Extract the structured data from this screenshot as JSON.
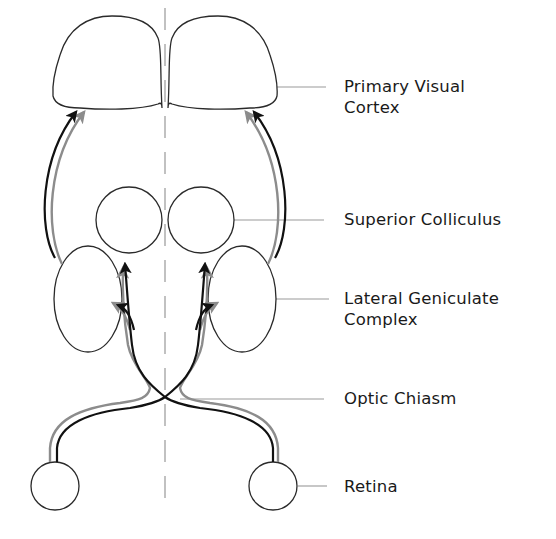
{
  "diagram": {
    "colors": {
      "background": "#ffffff",
      "outline": "#2a2a2a",
      "black_path": "#111111",
      "gray_path": "#8c8c8c",
      "midline": "#a0a0a0",
      "leader": "#9a9a9a",
      "label_text": "#1a1a1a"
    },
    "labels": [
      {
        "id": "primary-visual-cortex",
        "line1": "Primary Visual",
        "line2": "Cortex"
      },
      {
        "id": "superior-colliculus",
        "line1": "Superior Colliculus",
        "line2": ""
      },
      {
        "id": "lateral-geniculate-complex",
        "line1": "Lateral Geniculate",
        "line2": "Complex"
      },
      {
        "id": "optic-chiasm",
        "line1": "Optic Chiasm",
        "line2": ""
      },
      {
        "id": "retina",
        "line1": "Retina",
        "line2": ""
      }
    ],
    "structures": [
      "left-visual-cortex",
      "right-visual-cortex",
      "left-superior-colliculus",
      "right-superior-colliculus",
      "left-lateral-geniculate",
      "right-lateral-geniculate",
      "optic-chiasm",
      "left-retina",
      "right-retina"
    ],
    "pathways": [
      "black-pathway",
      "gray-pathway"
    ]
  }
}
